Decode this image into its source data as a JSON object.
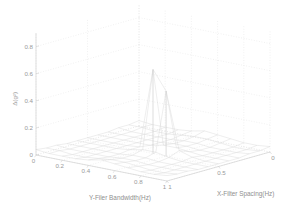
{
  "figure": {
    "background_color": "#ffffff",
    "mesh_color": "#d8d8d8",
    "grid_color": "#e2e2e2",
    "axis_color": "#c9c9c9",
    "text_color": "#9a9a9a"
  },
  "chart_data": {
    "type": "surface",
    "title": "",
    "xlabel": "X-Filter Spacing(Hz)",
    "ylabel": "Y-Filer Bandwidth(Hz)",
    "zlabel": "Δ(g²)",
    "xlim": [
      0,
      1
    ],
    "ylim": [
      0,
      1
    ],
    "zlim": [
      0,
      0.9
    ],
    "xticks": [
      "1",
      "0.5",
      "0"
    ],
    "yticks": [
      "0",
      "0.2",
      "0.4",
      "0.6",
      "0.8",
      "1"
    ],
    "zticks": [
      "0",
      "0.2",
      "0.4",
      "0.6",
      "0.8"
    ],
    "grid": true,
    "legend": null,
    "x": [
      0.0,
      0.1,
      0.2,
      0.3,
      0.4,
      0.5,
      0.6,
      0.7,
      0.8,
      0.9,
      1.0
    ],
    "y": [
      0.0,
      0.1,
      0.2,
      0.3,
      0.4,
      0.5,
      0.6,
      0.7,
      0.8,
      0.9,
      1.0
    ],
    "z": [
      [
        0.04,
        0.03,
        0.03,
        0.02,
        0.02,
        0.02,
        0.02,
        0.02,
        0.03,
        0.03,
        0.04
      ],
      [
        0.03,
        0.03,
        0.02,
        0.02,
        0.02,
        0.02,
        0.02,
        0.02,
        0.02,
        0.03,
        0.03
      ],
      [
        0.03,
        0.02,
        0.02,
        0.02,
        0.02,
        0.02,
        0.02,
        0.02,
        0.02,
        0.02,
        0.03
      ],
      [
        0.03,
        0.02,
        0.02,
        0.02,
        0.02,
        0.02,
        0.02,
        0.02,
        0.02,
        0.02,
        0.03
      ],
      [
        0.04,
        0.03,
        0.02,
        0.02,
        0.02,
        0.03,
        0.03,
        0.02,
        0.02,
        0.03,
        0.04
      ],
      [
        0.06,
        0.04,
        0.03,
        0.03,
        0.04,
        0.62,
        0.05,
        0.03,
        0.03,
        0.04,
        0.06
      ],
      [
        0.05,
        0.04,
        0.03,
        0.03,
        0.04,
        0.48,
        0.05,
        0.03,
        0.03,
        0.04,
        0.05
      ],
      [
        0.04,
        0.03,
        0.02,
        0.02,
        0.03,
        0.06,
        0.03,
        0.02,
        0.02,
        0.03,
        0.04
      ],
      [
        0.03,
        0.02,
        0.02,
        0.02,
        0.02,
        0.03,
        0.02,
        0.02,
        0.02,
        0.02,
        0.03
      ],
      [
        0.03,
        0.02,
        0.02,
        0.02,
        0.02,
        0.02,
        0.02,
        0.02,
        0.02,
        0.02,
        0.03
      ],
      [
        0.04,
        0.03,
        0.03,
        0.02,
        0.02,
        0.02,
        0.02,
        0.02,
        0.03,
        0.03,
        0.04
      ]
    ],
    "annotations": [
      {
        "label": "spike",
        "x": 0.5,
        "y": 0.5,
        "z": 0.62
      },
      {
        "label": "spike",
        "x": 0.5,
        "y": 0.6,
        "z": 0.48
      }
    ]
  }
}
